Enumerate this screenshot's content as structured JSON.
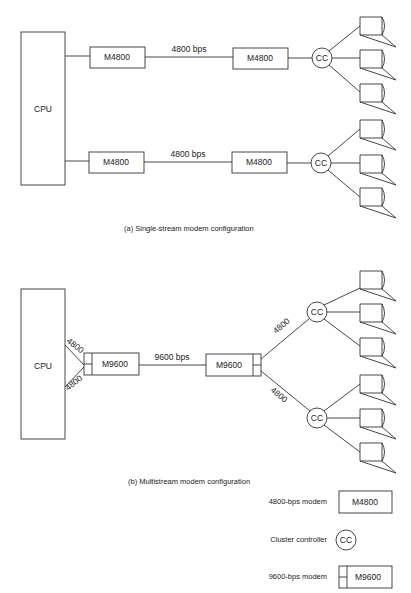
{
  "diagram_a": {
    "cpu_label": "CPU",
    "modem_label": "M4800",
    "link_label": "4800 bps",
    "cc_label": "CC",
    "caption": "(a)  Single-stream modem configuration"
  },
  "diagram_b": {
    "cpu_label": "CPU",
    "modem_label": "M9600",
    "link_label": "9600 bps",
    "cpu_link_upper": "4800",
    "cpu_link_lower": "4800",
    "cc_link_upper": "4800",
    "cc_link_lower": "4800",
    "cc_label": "CC",
    "caption": "(b)  Multistream modem configuration"
  },
  "legend": {
    "items": [
      {
        "label": "4800-bps modem",
        "symbol": "M4800"
      },
      {
        "label": "Cluster controller",
        "symbol": "CC"
      },
      {
        "label": "9600-bps modem",
        "symbol": "M9600"
      }
    ]
  }
}
